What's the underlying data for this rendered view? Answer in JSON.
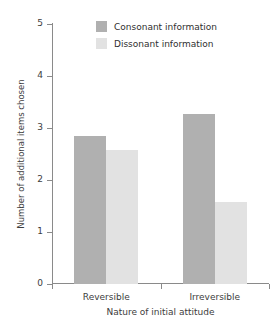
{
  "chart_data": {
    "type": "bar",
    "title": "",
    "subtitle": "",
    "xlabel": "Nature of initial attitude",
    "ylabel": "Number of additional items chosen",
    "categories": [
      "Reversible",
      "Irreversible"
    ],
    "series": [
      {
        "name": "Consonant information",
        "color": "#b0b0b0",
        "values": [
          2.85,
          3.27
        ]
      },
      {
        "name": "Dissonant information",
        "color": "#e2e2e2",
        "values": [
          2.57,
          1.57
        ]
      }
    ],
    "ylim": [
      0,
      5
    ],
    "yticks": [
      0,
      1,
      2,
      3,
      4,
      5
    ],
    "ytick_labels": [
      "0",
      "1",
      "2",
      "3",
      "4",
      "5"
    ],
    "grid": false,
    "legend_position": "top-center"
  },
  "axes": {
    "y_title": "Number of additional items chosen",
    "x_title": "Nature of initial attitude"
  },
  "legend": {
    "entries": [
      {
        "label": "Consonant information",
        "color": "#b0b0b0"
      },
      {
        "label": "Dissonant information",
        "color": "#e2e2e2"
      }
    ]
  },
  "colors": {
    "consonant": "#b0b0b0",
    "dissonant": "#e2e2e2",
    "axis": "#8a8a8a",
    "text": "#3d3d3d",
    "background": "#ffffff"
  }
}
